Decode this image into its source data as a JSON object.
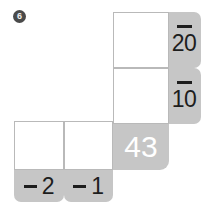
{
  "problem": {
    "number": "6",
    "start_value": "43"
  },
  "minus_sign": "–",
  "right_steps": [
    {
      "operator": "–",
      "value": "20"
    },
    {
      "operator": "–",
      "value": "10"
    }
  ],
  "bottom_steps": [
    {
      "operator": "–",
      "value": "2"
    },
    {
      "operator": "–",
      "value": "1"
    }
  ],
  "answer_cells": [
    {
      "id": "cell-top-right",
      "value": ""
    },
    {
      "id": "cell-mid-right",
      "value": ""
    },
    {
      "id": "cell-bottom-left",
      "value": ""
    },
    {
      "id": "cell-bottom-middle",
      "value": ""
    }
  ],
  "colors": {
    "tab_grey": "#c6c6c6",
    "cell_border": "#b9b9b9",
    "badge_dark": "#4a4a4a",
    "text_dark": "#1d1d1d",
    "total_text": "#ffffff"
  }
}
